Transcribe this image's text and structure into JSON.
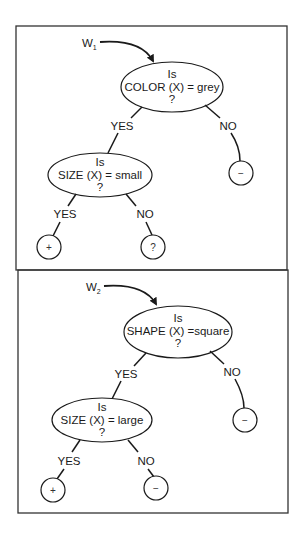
{
  "colors": {
    "ink": "#1a1a1a",
    "background": "#ffffff",
    "frame": "#333333"
  },
  "panels": [
    {
      "hypothesis_label": "W",
      "hypothesis_subscript": "1",
      "root": {
        "line1": "Is",
        "line2": "COLOR (X) = grey",
        "line3": "?"
      },
      "root_yes_label": "YES",
      "root_no_label": "NO",
      "root_no_leaf": "−",
      "child": {
        "line1": "Is",
        "line2": "SIZE (X) = small",
        "line3": "?"
      },
      "child_yes_label": "YES",
      "child_no_label": "NO",
      "child_yes_leaf": "+",
      "child_no_leaf": "?"
    },
    {
      "hypothesis_label": "W",
      "hypothesis_subscript": "2",
      "root": {
        "line1": "Is",
        "line2": "SHAPE (X) =square",
        "line3": "?"
      },
      "root_yes_label": "YES",
      "root_no_label": "NO",
      "root_no_leaf": "−",
      "child": {
        "line1": "Is",
        "line2": "SIZE (X) = large",
        "line3": "?"
      },
      "child_yes_label": "YES",
      "child_no_label": "NO",
      "child_yes_leaf": "+",
      "child_no_leaf": "−"
    }
  ]
}
